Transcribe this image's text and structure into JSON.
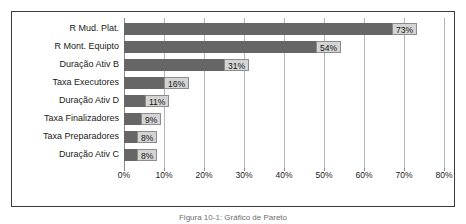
{
  "caption": "Figura 10-1: Gráfico de Pareto",
  "chart_data": {
    "type": "bar",
    "orientation": "horizontal",
    "title": "",
    "xlabel": "",
    "ylabel": "",
    "categories": [
      "R Mud. Plat.",
      "R Mont. Equipto",
      "Duração Ativ B",
      "Taxa Executores",
      "Duração Ativ D",
      "Taxa Finalizadores",
      "Taxa Preparadores",
      "Duração Ativ C"
    ],
    "values": [
      73,
      54,
      31,
      16,
      11,
      9,
      8,
      8
    ],
    "data_labels": [
      "73%",
      "54%",
      "31%",
      "16%",
      "11%",
      "9%",
      "8%",
      "8%"
    ],
    "xlim": [
      0,
      80
    ],
    "xticks": [
      0,
      10,
      20,
      30,
      40,
      50,
      60,
      70,
      80
    ],
    "xticklabels": [
      "0%",
      "10%",
      "20%",
      "30%",
      "40%",
      "50%",
      "60%",
      "70%",
      "80%"
    ],
    "grid": true,
    "grid_axis": "x",
    "legend": false,
    "bar_color": "#666666",
    "label_box_color": "#d4d4d4",
    "gridline_color": "#b4b4b4",
    "plot_background": "#ffffff",
    "frame_color": "#3a3a3a"
  }
}
